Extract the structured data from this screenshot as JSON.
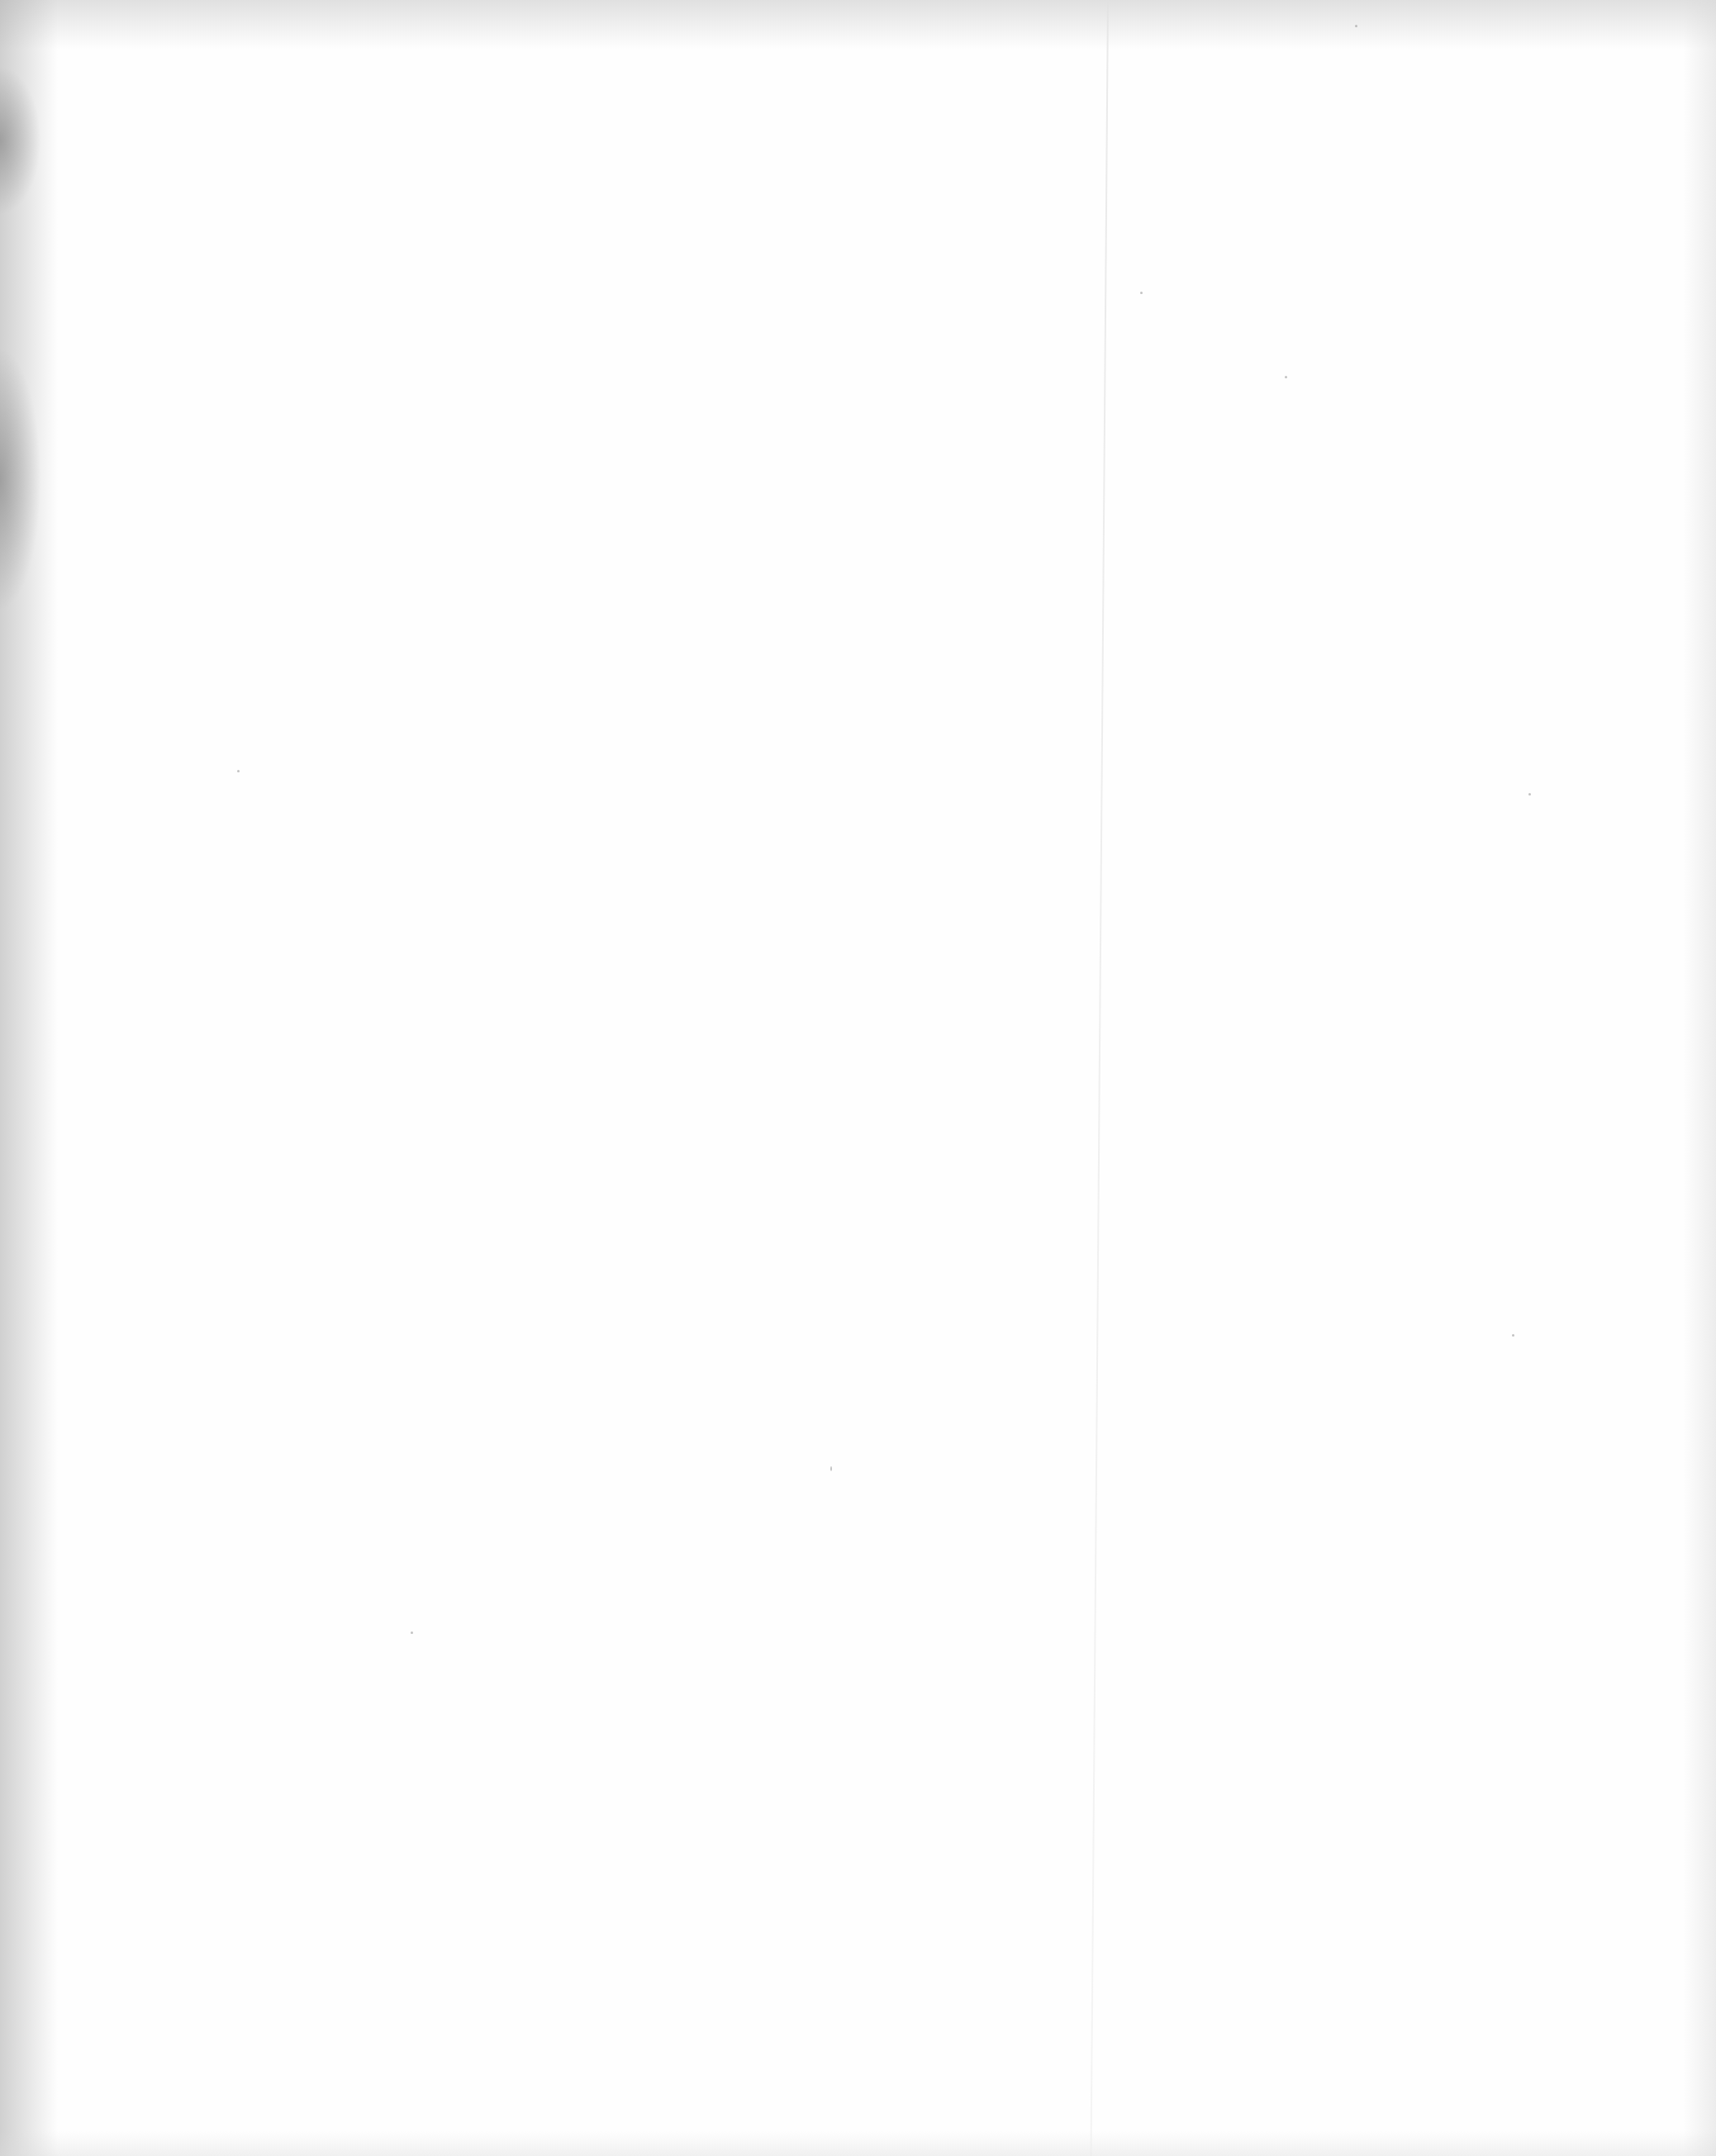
{
  "document": {
    "type": "blank scanned page",
    "text": ""
  },
  "colors": {
    "paper": "#fefefe",
    "edge_shadow": "#aaaaaa",
    "fold_line": "#e1e1e1"
  }
}
